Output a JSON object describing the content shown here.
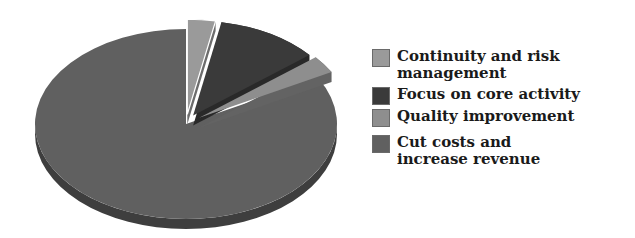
{
  "chart_data": {
    "type": "pie",
    "title": "",
    "style": "3d-exploded",
    "categories": [
      "Continuity and risk management",
      "Focus on core activity",
      "Quality improvement",
      "Cut costs and increase revenue"
    ],
    "values": [
      3,
      11,
      3,
      83
    ],
    "unit": "%",
    "colors": [
      "#9a9a9a",
      "#3a3a3a",
      "#8e8e8e",
      "#606060"
    ],
    "legend_position": "right"
  },
  "legend": {
    "items": [
      {
        "label_line1": "Continuity and risk",
        "label_line2": "management",
        "color": "#9a9a9a"
      },
      {
        "label_line1": "Focus on core activity",
        "label_line2": "",
        "color": "#3a3a3a"
      },
      {
        "label_line1": "Quality improvement",
        "label_line2": "",
        "color": "#8e8e8e"
      },
      {
        "label_line1": "Cut costs and",
        "label_line2": "increase revenue",
        "color": "#606060"
      }
    ]
  }
}
